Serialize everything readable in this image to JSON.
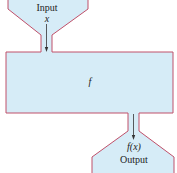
{
  "diagram": {
    "type": "function-machine",
    "colors": {
      "fill": "#d6ecf7",
      "stroke": "#c0506a",
      "arrow": "#333333",
      "text": "#222222"
    },
    "input": {
      "label": "Input",
      "variable": "x"
    },
    "machine": {
      "label": "f"
    },
    "output": {
      "expression": "f(x)",
      "label": "Output"
    }
  }
}
